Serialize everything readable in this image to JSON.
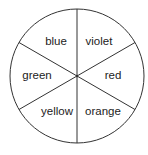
{
  "diagram": {
    "type": "spinner",
    "sectors": [
      {
        "label": "blue",
        "x": 56,
        "y": 45
      },
      {
        "label": "violet",
        "x": 99,
        "y": 45
      },
      {
        "label": "red",
        "x": 113,
        "y": 79
      },
      {
        "label": "orange",
        "x": 103,
        "y": 115
      },
      {
        "label": "yellow",
        "x": 57,
        "y": 115
      },
      {
        "label": "green",
        "x": 37,
        "y": 79
      }
    ],
    "stroke_color": "#333333"
  }
}
